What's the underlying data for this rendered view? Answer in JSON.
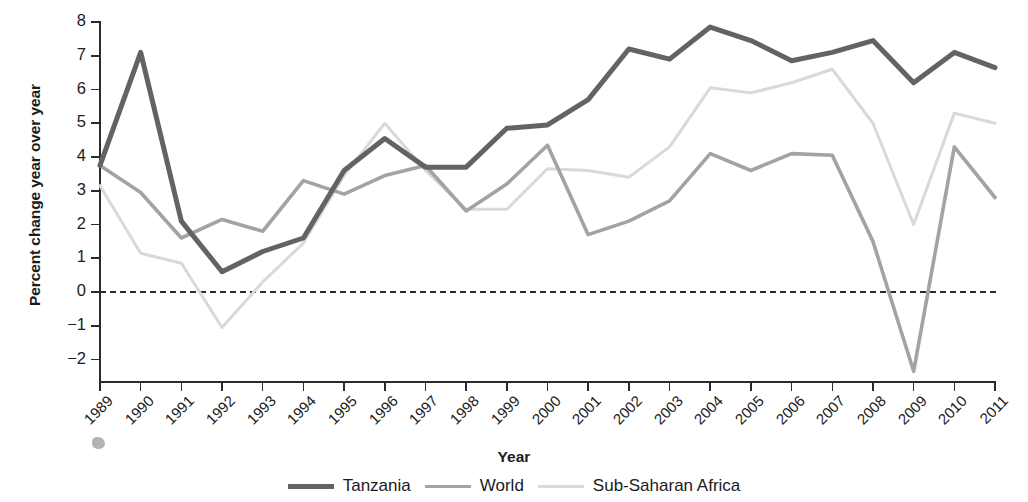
{
  "axes": {
    "ylabel": "Percent change year over year",
    "xlabel": "Year",
    "yticks": [
      "8",
      "7",
      "6",
      "5",
      "4",
      "3",
      "2",
      "1",
      "0",
      "−1",
      "−2"
    ]
  },
  "legend": {
    "items": [
      {
        "label": "Tanzania",
        "color": "#636363",
        "width": 5.0
      },
      {
        "label": "World",
        "color": "#a3a3a3",
        "width": 3.6
      },
      {
        "label": "Sub-Saharan Africa",
        "color": "#d9d9d9",
        "width": 3.0
      }
    ]
  },
  "chart_data": {
    "type": "line",
    "title": "",
    "xlabel": "Year",
    "ylabel": "Percent change year over year",
    "grid": false,
    "legend_position": "bottom",
    "xlim": [
      1989,
      2011
    ],
    "ylim": [
      -2.6,
      8.0
    ],
    "yticks": [
      8,
      7,
      6,
      5,
      4,
      3,
      2,
      1,
      0,
      -1,
      -2
    ],
    "zero_reference_line": 0,
    "categories": [
      "1989",
      "1990",
      "1991",
      "1992",
      "1993",
      "1994",
      "1995",
      "1996",
      "1997",
      "1998",
      "1999",
      "2000",
      "2001",
      "2002",
      "2003",
      "2004",
      "2005",
      "2006",
      "2007",
      "2008",
      "2009",
      "2010",
      "2011"
    ],
    "series": [
      {
        "name": "Tanzania",
        "color": "#636363",
        "values": [
          3.75,
          7.1,
          2.1,
          0.6,
          1.2,
          1.6,
          3.6,
          4.55,
          3.7,
          3.7,
          4.85,
          4.95,
          5.7,
          7.2,
          6.9,
          7.85,
          7.45,
          6.85,
          7.1,
          7.45,
          6.2,
          7.1,
          6.65
        ]
      },
      {
        "name": "World",
        "color": "#a3a3a3",
        "values": [
          3.75,
          2.95,
          1.6,
          2.15,
          1.8,
          3.3,
          2.9,
          3.45,
          3.75,
          2.4,
          3.2,
          4.35,
          1.7,
          2.1,
          2.7,
          4.1,
          3.6,
          4.1,
          4.05,
          1.5,
          -2.35,
          4.3,
          2.8
        ]
      },
      {
        "name": "Sub-Saharan Africa",
        "color": "#d9d9d9",
        "values": [
          3.15,
          1.15,
          0.85,
          -1.05,
          0.3,
          1.45,
          3.45,
          5.0,
          3.6,
          2.45,
          2.45,
          3.65,
          3.6,
          3.4,
          4.3,
          6.05,
          5.9,
          6.2,
          6.6,
          5.0,
          2.0,
          5.3,
          5.0
        ]
      }
    ]
  }
}
